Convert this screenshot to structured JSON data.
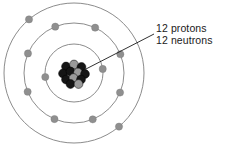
{
  "figure": {
    "background_color": "#ffffff"
  },
  "nucleus": {
    "label": "nucleus",
    "center_x": 74,
    "center_y": 73,
    "proton_color": "#151515",
    "neutron_color": "#9a9a9a",
    "particle_radius": 4.4,
    "particles": [
      {
        "type": "proton",
        "x": -8.0,
        "y": -6.5
      },
      {
        "type": "neutron",
        "x": 0.0,
        "y": -8.5
      },
      {
        "type": "proton",
        "x": 7.5,
        "y": -6.0
      },
      {
        "type": "proton",
        "x": -11.0,
        "y": 0.5
      },
      {
        "type": "proton",
        "x": -3.5,
        "y": -1.5
      },
      {
        "type": "neutron",
        "x": 4.0,
        "y": -0.5
      },
      {
        "type": "proton",
        "x": 11.0,
        "y": 1.0
      },
      {
        "type": "proton",
        "x": -8.0,
        "y": 6.5
      },
      {
        "type": "neutron",
        "x": -0.5,
        "y": 5.0
      },
      {
        "type": "proton",
        "x": 7.0,
        "y": 6.5
      },
      {
        "type": "proton",
        "x": -3.5,
        "y": 11.0
      },
      {
        "type": "neutron",
        "x": 4.5,
        "y": 11.0
      }
    ]
  },
  "shells": [
    {
      "name": "shell-1",
      "radius": 29,
      "electron_count": 2,
      "electrons": [
        {
          "angle": 8
        },
        {
          "angle": 188
        }
      ]
    },
    {
      "name": "shell-2",
      "radius": 50,
      "electron_count": 8,
      "electrons": [
        {
          "angle": 22
        },
        {
          "angle": 65
        },
        {
          "angle": 112
        },
        {
          "angle": 157
        },
        {
          "angle": 202
        },
        {
          "angle": 247
        },
        {
          "angle": 292
        },
        {
          "angle": 337
        }
      ]
    },
    {
      "name": "shell-3",
      "radius": 70,
      "electron_count": 2,
      "electrons": [
        {
          "angle": 130
        },
        {
          "angle": 310
        }
      ]
    }
  ],
  "orbit_style": {
    "stroke_color": "#8c8c8c",
    "stroke_width": 1.0,
    "electron_color": "#8f8f8f",
    "electron_radius": 3.6
  },
  "callout": {
    "name": "nucleus-callout",
    "lines": [
      "12 protons",
      "12 neutrons"
    ],
    "leader": {
      "from_x": 84,
      "from_y": 70,
      "to_x": 154,
      "to_y": 34,
      "stroke_color": "#1a1a1a",
      "stroke_width": 0.9
    },
    "text_color": "#1a1a1a"
  }
}
